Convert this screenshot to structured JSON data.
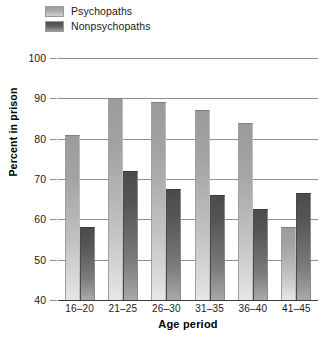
{
  "chart_data": {
    "type": "bar",
    "title": "",
    "xlabel": "Age period",
    "ylabel": "Percent in prison",
    "categories": [
      "16–20",
      "21–25",
      "26–30",
      "31–35",
      "36–40",
      "41–45"
    ],
    "series": [
      {
        "name": "Psychopaths",
        "color": "#a8a8a8",
        "values": [
          81,
          90,
          89,
          87,
          84,
          58
        ]
      },
      {
        "name": "Nonpsychopaths",
        "color": "#565656",
        "values": [
          58,
          72,
          67.5,
          66,
          62.5,
          66.5
        ]
      }
    ],
    "ylim": [
      40,
      100
    ],
    "yticks": [
      40,
      50,
      60,
      70,
      80,
      90,
      100
    ],
    "ytick_labels": [
      "40",
      "50",
      "60",
      "70",
      "80",
      "90",
      "100"
    ],
    "grid": true,
    "grid_axis": "y",
    "legend_position": "top-left",
    "bar_style": "vertical-gradient-fill"
  },
  "legend": {
    "items": [
      {
        "label": "Psychopaths"
      },
      {
        "label": "Nonpsychopaths"
      }
    ]
  },
  "axes": {
    "x_title": "Age period",
    "y_title": "Percent in prison"
  }
}
